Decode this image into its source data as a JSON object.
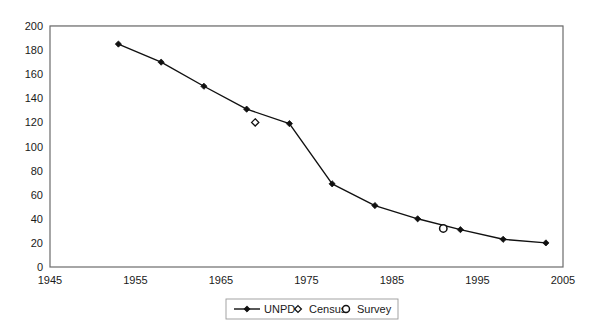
{
  "chart_data": {
    "type": "line",
    "title": "",
    "subtitle": "",
    "xlabel": "",
    "ylabel": "",
    "xlim": [
      1945,
      2005
    ],
    "ylim": [
      0,
      200
    ],
    "grid": true,
    "grid_axis": "y",
    "legend_position": "bottom-center",
    "x_ticks": [
      1945,
      1955,
      1965,
      1975,
      1985,
      1995,
      2005
    ],
    "x_tick_labels": [
      "1945",
      "1955",
      "1965",
      "1975",
      "1985",
      "1995",
      "2005"
    ],
    "y_ticks": [
      0,
      20,
      40,
      60,
      80,
      100,
      120,
      140,
      160,
      180,
      200
    ],
    "y_tick_labels": [
      "0",
      "20",
      "40",
      "60",
      "80",
      "100",
      "120",
      "140",
      "160",
      "180",
      "200"
    ],
    "series": [
      {
        "name": "UNPD",
        "marker": "filled-diamond",
        "line": true,
        "color": "#111111",
        "points": [
          {
            "x": 1953,
            "y": 185
          },
          {
            "x": 1958,
            "y": 170
          },
          {
            "x": 1963,
            "y": 150
          },
          {
            "x": 1968,
            "y": 131
          },
          {
            "x": 1973,
            "y": 119
          },
          {
            "x": 1978,
            "y": 69
          },
          {
            "x": 1983,
            "y": 51
          },
          {
            "x": 1988,
            "y": 40
          },
          {
            "x": 1993,
            "y": 31
          },
          {
            "x": 1998,
            "y": 23
          },
          {
            "x": 2003,
            "y": 20
          }
        ]
      },
      {
        "name": "Census",
        "marker": "open-diamond",
        "line": false,
        "color": "#111111",
        "points": [
          {
            "x": 1969,
            "y": 120
          }
        ]
      },
      {
        "name": "Survey",
        "marker": "open-circle",
        "line": false,
        "color": "#111111",
        "points": [
          {
            "x": 1991,
            "y": 32
          }
        ]
      }
    ]
  },
  "legend": {
    "items": [
      {
        "label": "UNPD",
        "marker": "line-with-filled-diamond"
      },
      {
        "label": "Census",
        "marker": "open-diamond"
      },
      {
        "label": "Survey",
        "marker": "open-circle"
      }
    ]
  },
  "colors": {
    "series": "#111111",
    "grid": "#c8c8c8",
    "axis": "#6b6b6b",
    "background": "#ffffff"
  }
}
